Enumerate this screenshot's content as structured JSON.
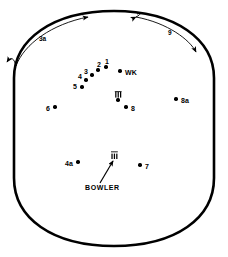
{
  "diagram": {
    "bowler_label": "BOWLER",
    "keeper_label": "WK",
    "stroke_color": "#000000",
    "background_color": "#ffffff",
    "boundary_shape": "oval-flat-sides"
  },
  "arcs": [
    {
      "id": "arc-left",
      "label": "3a",
      "direction": "clockwise",
      "side": "left"
    },
    {
      "id": "arc-right",
      "label": "9",
      "direction": "clockwise",
      "side": "right"
    }
  ],
  "wickets": [
    {
      "id": "batsman-wicket",
      "name": "striker-stumps",
      "x": 118,
      "y": 101
    },
    {
      "id": "bowler-wicket",
      "name": "bowler-stumps",
      "x": 114,
      "y": 158
    }
  ],
  "fielders": [
    {
      "label": "1",
      "name": "fielder-1",
      "x": 106,
      "y": 67,
      "label_dx": -1,
      "label_dy": -9
    },
    {
      "label": "2",
      "name": "fielder-2",
      "x": 98,
      "y": 70,
      "label_dx": -1,
      "label_dy": -9
    },
    {
      "label": "3",
      "name": "fielder-3",
      "x": 92,
      "y": 75,
      "label_dx": -8,
      "label_dy": -7
    },
    {
      "label": "4",
      "name": "fielder-4",
      "x": 86,
      "y": 80,
      "label_dx": -8,
      "label_dy": -7
    },
    {
      "label": "5",
      "name": "fielder-5",
      "x": 82,
      "y": 87,
      "label_dx": -9,
      "label_dy": -4
    },
    {
      "label": "6",
      "name": "fielder-6",
      "x": 55,
      "y": 107,
      "label_dx": -9,
      "label_dy": -2
    },
    {
      "label": "7",
      "name": "fielder-7",
      "x": 140,
      "y": 165,
      "label_dx": 5,
      "label_dy": -2
    },
    {
      "label": "8",
      "name": "fielder-8",
      "x": 126,
      "y": 107,
      "label_dx": 5,
      "label_dy": -2
    },
    {
      "label": "8a",
      "name": "fielder-8a",
      "x": 176,
      "y": 99,
      "label_dx": 5,
      "label_dy": -2
    },
    {
      "label": "4a",
      "name": "fielder-4a",
      "x": 78,
      "y": 162,
      "label_dx": -13,
      "label_dy": -2
    }
  ],
  "keeper": {
    "name": "wicket-keeper",
    "x": 120,
    "y": 71,
    "label_dx": 5,
    "label_dy": -2
  }
}
